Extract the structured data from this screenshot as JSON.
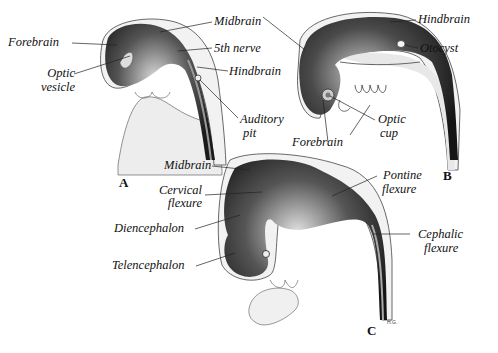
{
  "figure": {
    "panels": [
      {
        "id": "A",
        "labels": {
          "forebrain": "Forebrain",
          "optic_vesicle_1": "Optic",
          "optic_vesicle_2": "vesicle",
          "midbrain": "Midbrain",
          "fifth_nerve": "5th nerve",
          "hindbrain": "Hindbrain",
          "auditory_pit_1": "Auditory",
          "auditory_pit_2": "pit"
        }
      },
      {
        "id": "B",
        "labels": {
          "hindbrain": "Hindbrain",
          "otocyst": "Otocyst",
          "optic_cup_1": "Optic",
          "optic_cup_2": "cup",
          "forebrain": "Forebrain"
        }
      },
      {
        "id": "C",
        "labels": {
          "midbrain": "Midbrain",
          "cervical_flexure_1": "Cervical",
          "cervical_flexure_2": "flexure",
          "diencephalon": "Diencephalon",
          "telencephalon": "Telencephalon",
          "pontine_flexure_1": "Pontine",
          "pontine_flexure_2": "flexure",
          "cephalic_flexure_1": "Cephalic",
          "cephalic_flexure_2": "flexure"
        },
        "signature": "H.G."
      }
    ],
    "colors": {
      "background": "#ffffff",
      "brain_tissue": "#2a2a2a",
      "embryo_body": "#eeeeee",
      "outline": "#333333",
      "text": "#111111"
    }
  }
}
